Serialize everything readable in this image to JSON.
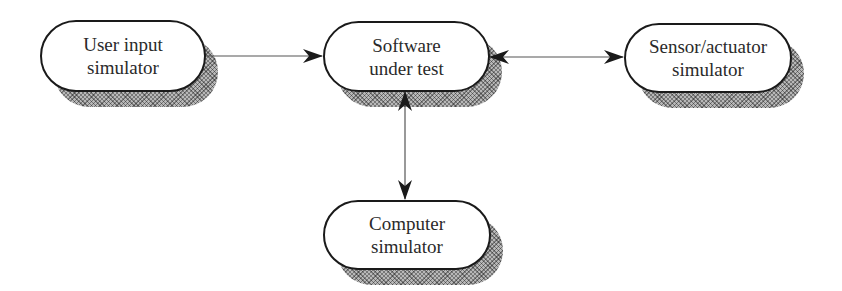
{
  "diagram": {
    "type": "block-diagram",
    "nodes": [
      {
        "id": "user",
        "label_line1": "User input",
        "label_line2": "simulator"
      },
      {
        "id": "software",
        "label_line1": "Software",
        "label_line2": "under test"
      },
      {
        "id": "sensor",
        "label_line1": "Sensor/actuator",
        "label_line2": "simulator"
      },
      {
        "id": "computer",
        "label_line1": "Computer",
        "label_line2": "simulator"
      }
    ],
    "edges": [
      {
        "from": "user",
        "to": "software",
        "direction": "one-way"
      },
      {
        "from": "software",
        "to": "sensor",
        "direction": "bidirectional"
      },
      {
        "from": "software",
        "to": "computer",
        "direction": "bidirectional"
      }
    ]
  },
  "colors": {
    "border": "#1a1a1a",
    "text": "#2a2a2a",
    "shadow": "#b8b8b8",
    "line": "#555555"
  }
}
